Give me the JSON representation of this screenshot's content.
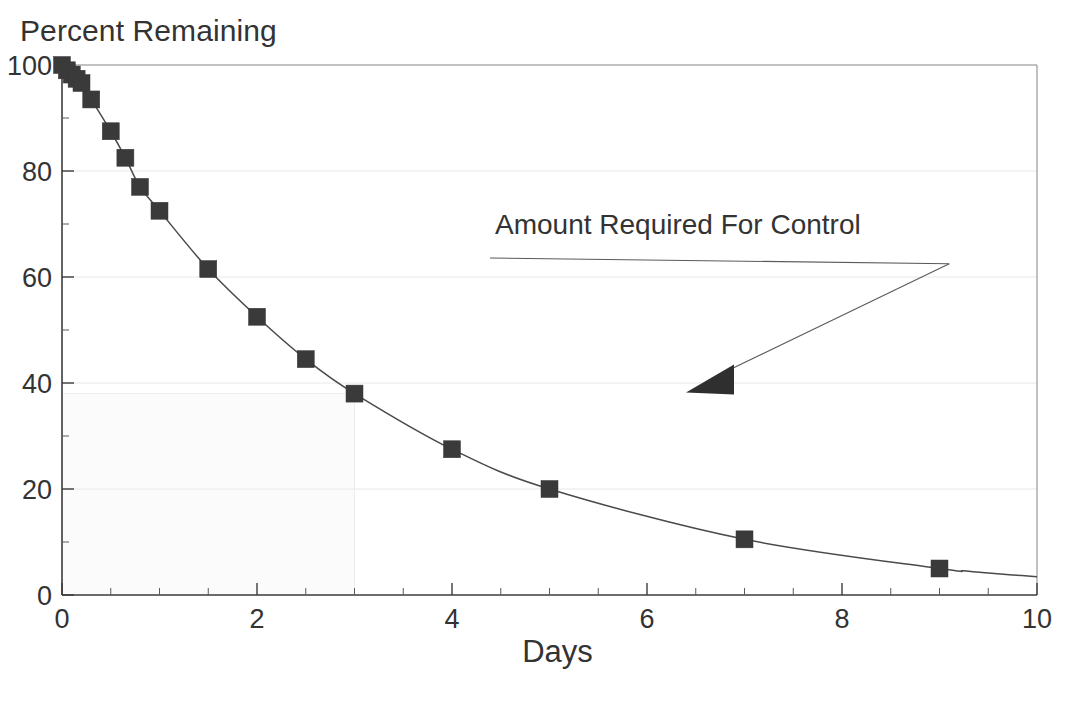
{
  "chart_data": {
    "type": "line",
    "title": "",
    "ylabel": "Percent Remaining",
    "xlabel": "Days",
    "xlim": [
      0,
      10
    ],
    "ylim": [
      0,
      100
    ],
    "xticks": [
      0,
      2,
      4,
      6,
      8,
      10
    ],
    "xtick_labels": [
      "0",
      "2",
      "4",
      "6",
      "8",
      "10"
    ],
    "yticks": [
      0,
      20,
      40,
      60,
      80,
      100
    ],
    "ytick_labels": [
      "0",
      "20",
      "40",
      "60",
      "80",
      "100"
    ],
    "x_minor_tick_step": 0.5,
    "y_minor_tick_step": 10,
    "grid": true,
    "grid_color": "#e8e8e8",
    "legend": "none",
    "marker": "square",
    "marker_color": "#3a3a3a",
    "line_color": "#4a4a4a",
    "series": [
      {
        "name": "Percent Remaining",
        "x": [
          0.0,
          0.04,
          0.08,
          0.12,
          0.17,
          0.25,
          0.33,
          0.5,
          0.65,
          0.8,
          1.0,
          1.5,
          2.0,
          2.5,
          3.0,
          4.0,
          5.0,
          7.0,
          9.0
        ],
        "values": [
          100,
          99.5,
          99,
          98.5,
          98,
          97,
          96,
          93.5,
          87.5,
          82.5,
          77,
          72.5,
          61.5,
          52.5,
          44.5,
          38,
          27.5,
          20,
          10.5
        ],
        "values_note": "percent of applied material remaining"
      }
    ],
    "points": [
      {
        "x": 0.0,
        "y": 100
      },
      {
        "x": 0.05,
        "y": 99
      },
      {
        "x": 0.1,
        "y": 98.2
      },
      {
        "x": 0.15,
        "y": 97.4
      },
      {
        "x": 0.2,
        "y": 96.6
      },
      {
        "x": 0.3,
        "y": 93.5
      },
      {
        "x": 0.5,
        "y": 87.5
      },
      {
        "x": 0.65,
        "y": 82.5
      },
      {
        "x": 0.8,
        "y": 77
      },
      {
        "x": 1.0,
        "y": 72.5
      },
      {
        "x": 1.5,
        "y": 61.5
      },
      {
        "x": 2.0,
        "y": 52.5
      },
      {
        "x": 2.5,
        "y": 44.5
      },
      {
        "x": 3.0,
        "y": 38
      },
      {
        "x": 4.0,
        "y": 27.5
      },
      {
        "x": 5.0,
        "y": 20
      },
      {
        "x": 7.0,
        "y": 10.5
      },
      {
        "x": 9.0,
        "y": 5
      }
    ],
    "annotations": [
      {
        "name": "amount-required-for-control",
        "text": "Amount Required For Control",
        "text_x": 6.0,
        "text_y": 64,
        "underline": true,
        "arrow_from_x": 9.1,
        "arrow_from_y": 62.5,
        "arrow_to_x": 6.4,
        "arrow_to_y": 38.2
      }
    ],
    "shaded_region": {
      "name": "control-threshold-region",
      "x_range": [
        0,
        3
      ],
      "y_range": [
        0,
        38
      ],
      "fill": "#fbfbfb",
      "note": "faint shaded box under the curve from day 0 to day 3"
    }
  },
  "annotation": {
    "label": "Amount Required For Control"
  },
  "axes": {
    "y_title": "Percent Remaining",
    "x_title": "Days"
  }
}
